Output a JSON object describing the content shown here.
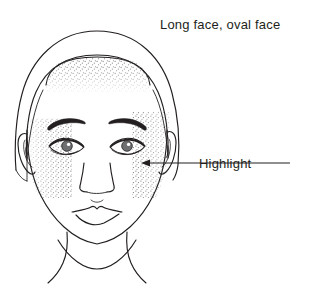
{
  "figure": {
    "title": "Long face, oval face",
    "background_color": "#ffffff",
    "line_color": "#231f20",
    "stipple_color": "#6b6b6e"
  },
  "caption": {
    "text": "Long face, oval face",
    "x": 160,
    "y": 29
  },
  "annotations": [
    {
      "id": "highlight",
      "label": "Highlight",
      "label_x": 199,
      "label_y": 168,
      "leader_from_x": 290,
      "leader_from_y": 163,
      "leader_to_x": 143,
      "leader_to_y": 163,
      "arrow_direction": "left",
      "target_region": "cheek stipple"
    }
  ],
  "regions": [
    {
      "name": "forehead-highlight",
      "render": "stipple",
      "description": "dotted shading band across the forehead below the hairline"
    },
    {
      "name": "left-cheek-highlight",
      "render": "stipple",
      "description": "dotted shading over the subject's right cheek (viewer left)"
    },
    {
      "name": "right-cheek-highlight",
      "render": "stipple",
      "description": "dotted shading over the subject's left cheek (viewer right)"
    }
  ],
  "features": [
    {
      "name": "hair",
      "render": "outline"
    },
    {
      "name": "face-oval",
      "render": "outline"
    },
    {
      "name": "left-ear",
      "render": "outline"
    },
    {
      "name": "right-ear",
      "render": "outline"
    },
    {
      "name": "left-eyebrow",
      "render": "filled"
    },
    {
      "name": "right-eyebrow",
      "render": "filled"
    },
    {
      "name": "left-eye",
      "render": "outline-with-iris"
    },
    {
      "name": "right-eye",
      "render": "outline-with-iris"
    },
    {
      "name": "nose",
      "render": "outline"
    },
    {
      "name": "mouth",
      "render": "outline"
    },
    {
      "name": "neck",
      "render": "outline"
    },
    {
      "name": "shoulders",
      "render": "outline"
    }
  ]
}
